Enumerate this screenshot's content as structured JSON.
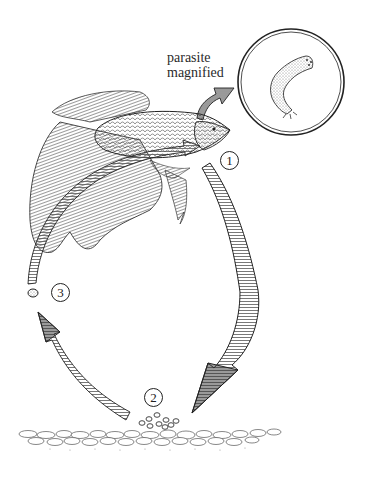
{
  "diagram": {
    "type": "life-cycle",
    "callout": {
      "line1": "parasite",
      "line2": "magnified"
    },
    "stages": [
      {
        "number": "1",
        "description": "parasite leaves fish"
      },
      {
        "number": "2",
        "description": "cysts on gravel substrate"
      },
      {
        "number": "3",
        "description": "free-swimming stage returns to fish"
      }
    ],
    "colors": {
      "ink": "#222222",
      "background": "#ffffff",
      "hatch": "#555555",
      "arrow_head_dark": "#444444"
    }
  }
}
